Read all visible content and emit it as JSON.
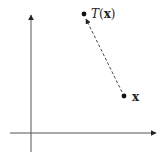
{
  "diagram": {
    "type": "vector-transformation",
    "axes": {
      "x_axis": {
        "from": [
          10,
          133
        ],
        "to": [
          158,
          133
        ]
      },
      "y_axis": {
        "from": [
          31,
          152
        ],
        "to": [
          31,
          13
        ]
      },
      "color": "#555555"
    },
    "points": [
      {
        "id": "x",
        "pos": [
          124,
          96
        ],
        "label_bold": "x"
      },
      {
        "id": "Tx",
        "pos": [
          84,
          14
        ],
        "label_func": "T",
        "label_open": "(",
        "label_arg": "x",
        "label_close": ")"
      }
    ],
    "arrow": {
      "from": "x",
      "to": "Tx",
      "style": "dashed",
      "color": "#333333"
    }
  }
}
